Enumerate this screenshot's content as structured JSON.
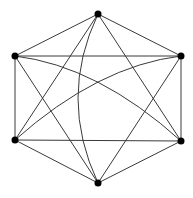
{
  "diagram": {
    "type": "graph",
    "name": "K6 complete graph drawing",
    "colors": {
      "background": "#ffffff",
      "edge": "#3a3a3a",
      "vertex": "#000000"
    },
    "vertex_radius": 3.5,
    "vertices": [
      {
        "id": "top",
        "x": 98,
        "y": 14
      },
      {
        "id": "upper-left",
        "x": 15,
        "y": 56
      },
      {
        "id": "upper-right",
        "x": 181,
        "y": 56
      },
      {
        "id": "lower-left",
        "x": 15,
        "y": 140
      },
      {
        "id": "lower-right",
        "x": 181,
        "y": 141
      },
      {
        "id": "bottom",
        "x": 98,
        "y": 183
      }
    ],
    "edges": [
      {
        "from": "top",
        "to": "upper-left",
        "curve": null
      },
      {
        "from": "top",
        "to": "upper-right",
        "curve": null
      },
      {
        "from": "upper-left",
        "to": "upper-right",
        "curve": null
      },
      {
        "from": "upper-left",
        "to": "lower-left",
        "curve": null
      },
      {
        "from": "upper-right",
        "to": "lower-right",
        "curve": null
      },
      {
        "from": "lower-left",
        "to": "lower-right",
        "curve": null
      },
      {
        "from": "lower-left",
        "to": "bottom",
        "curve": null
      },
      {
        "from": "lower-right",
        "to": "bottom",
        "curve": null
      },
      {
        "from": "top",
        "to": "lower-left",
        "curve": null
      },
      {
        "from": "top",
        "to": "lower-right",
        "curve": null
      },
      {
        "from": "bottom",
        "to": "upper-left",
        "curve": null
      },
      {
        "from": "bottom",
        "to": "upper-right",
        "curve": null
      },
      {
        "from": "upper-left",
        "to": "lower-right",
        "curve": {
          "cx": 98,
          "cy": 66
        }
      },
      {
        "from": "lower-left",
        "to": "upper-right",
        "curve": {
          "cx": 98,
          "cy": 66
        }
      },
      {
        "from": "top",
        "to": "bottom",
        "curve": {
          "cx": 58,
          "cy": 98
        }
      }
    ]
  }
}
